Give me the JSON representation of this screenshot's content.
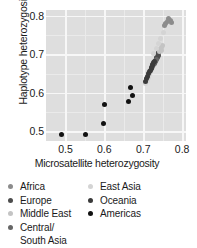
{
  "chart_data": {
    "type": "scatter",
    "title": "",
    "xlabel": "Microsatellite heterozygosity",
    "ylabel": "Haplotype heterozygosity",
    "xlim": [
      0.45,
      0.81
    ],
    "ylim": [
      0.475,
      0.815
    ],
    "xticks": [
      "0.5",
      "0.6",
      "0.7",
      "0.8"
    ],
    "xtick_values": [
      0.5,
      0.6,
      0.7,
      0.8
    ],
    "yticks": [
      "0.5",
      "0.6",
      "0.7",
      "0.8"
    ],
    "ytick_values": [
      0.5,
      0.6,
      0.7,
      0.8
    ],
    "grid": true,
    "panel_background": "#dedede",
    "gridline_color": "#f7f7f7",
    "legend_position": "below-plot",
    "series": [
      {
        "name": "Africa",
        "color": "#8c8c8c",
        "points": [
          [
            0.766,
            0.793
          ],
          [
            0.77,
            0.789
          ],
          [
            0.762,
            0.786
          ],
          [
            0.758,
            0.781
          ],
          [
            0.772,
            0.783
          ],
          [
            0.755,
            0.776
          ]
        ]
      },
      {
        "name": "Europe",
        "color": "#4d4d4d",
        "points": [
          [
            0.74,
            0.704
          ],
          [
            0.737,
            0.699
          ],
          [
            0.735,
            0.693
          ],
          [
            0.742,
            0.709
          ],
          [
            0.733,
            0.688
          ],
          [
            0.738,
            0.696
          ],
          [
            0.731,
            0.684
          ],
          [
            0.744,
            0.712
          ],
          [
            0.736,
            0.691
          ]
        ]
      },
      {
        "name": "Middle East",
        "color": "#c4c4c4",
        "points": [
          [
            0.744,
            0.713
          ],
          [
            0.748,
            0.718
          ],
          [
            0.741,
            0.707
          ],
          [
            0.746,
            0.71
          ],
          [
            0.75,
            0.722
          ]
        ]
      },
      {
        "name": "Central/\nSouth Asia",
        "color": "#666666",
        "points": [
          [
            0.729,
            0.679
          ],
          [
            0.726,
            0.673
          ],
          [
            0.732,
            0.682
          ],
          [
            0.723,
            0.668
          ],
          [
            0.735,
            0.686
          ],
          [
            0.728,
            0.676
          ],
          [
            0.721,
            0.665
          ],
          [
            0.73,
            0.68
          ]
        ]
      },
      {
        "name": "East Asia",
        "color": "#d4d4d4",
        "points": [
          [
            0.752,
            0.757
          ],
          [
            0.744,
            0.74
          ],
          [
            0.738,
            0.727
          ],
          [
            0.727,
            0.702
          ],
          [
            0.716,
            0.648
          ],
          [
            0.71,
            0.632
          ],
          [
            0.719,
            0.658
          ],
          [
            0.722,
            0.665
          ],
          [
            0.713,
            0.64
          ],
          [
            0.706,
            0.625
          ],
          [
            0.724,
            0.671
          ],
          [
            0.733,
            0.715
          ]
        ]
      },
      {
        "name": "Oceania",
        "color": "#3a3a3a",
        "points": [
          [
            0.724,
            0.672
          ],
          [
            0.72,
            0.663
          ],
          [
            0.727,
            0.678
          ],
          [
            0.717,
            0.656
          ],
          [
            0.714,
            0.65
          ],
          [
            0.722,
            0.667
          ],
          [
            0.711,
            0.643
          ],
          [
            0.725,
            0.674
          ],
          [
            0.718,
            0.659
          ],
          [
            0.709,
            0.637
          ],
          [
            0.73,
            0.681
          ],
          [
            0.705,
            0.63
          ]
        ]
      },
      {
        "name": "Americas",
        "color": "#111111",
        "points": [
          [
            0.49,
            0.493
          ],
          [
            0.552,
            0.493
          ],
          [
            0.599,
            0.52
          ],
          [
            0.6,
            0.57
          ],
          [
            0.662,
            0.578
          ],
          [
            0.672,
            0.592
          ],
          [
            0.666,
            0.613
          ]
        ]
      }
    ]
  },
  "axes": {
    "ylabel": "Haplotype heterozygosity",
    "xlabel": "Microsatellite heterozygosity",
    "yticks": [
      "0.8",
      "0.7",
      "0.6",
      "0.5"
    ],
    "xticks": [
      "0.5",
      "0.6",
      "0.7",
      "0.8"
    ]
  },
  "legend": {
    "left_column": [
      {
        "label": "Africa",
        "color": "#8c8c8c"
      },
      {
        "label": "Europe",
        "color": "#4d4d4d"
      },
      {
        "label": "Middle East",
        "color": "#c4c4c4"
      },
      {
        "label": "Central/\nSouth Asia",
        "color": "#666666"
      }
    ],
    "right_column": [
      {
        "label": "East Asia",
        "color": "#d4d4d4"
      },
      {
        "label": "Oceania",
        "color": "#3a3a3a"
      },
      {
        "label": "Americas",
        "color": "#111111"
      }
    ]
  }
}
